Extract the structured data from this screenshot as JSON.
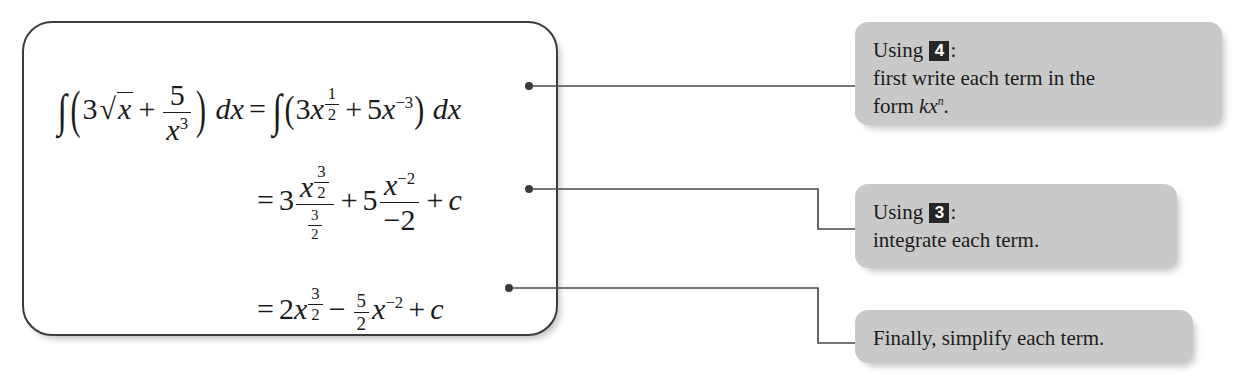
{
  "figure": {
    "type": "worked-example-with-callouts"
  },
  "work_box": {
    "equations": [
      {
        "id": "line-1",
        "plain": "∫(3√x + 5/x³) dx = ∫(3x^(1/2) + 5x^(-3)) dx",
        "parts": {
          "integral": "∫",
          "coefficient_1": "3",
          "radical": "√",
          "radicand": "x",
          "plus": "+",
          "frac_num": "5",
          "frac_den_base": "x",
          "frac_den_exp": "3",
          "dx": "dx",
          "equals": "=",
          "rhs_coeff_1": "3",
          "rhs_var_1": "x",
          "rhs_exp_1_num": "1",
          "rhs_exp_1_den": "2",
          "rhs_coeff_2": "5",
          "rhs_var_2": "x",
          "rhs_exp_2": "−3"
        }
      },
      {
        "id": "line-2",
        "plain": "= 3 · (x^(3/2))/(3/2) + 5 · (x^(-2))/(-2) + c",
        "parts": {
          "equals": "=",
          "coeff_1": "3",
          "num_var_1": "x",
          "num_exp_1_num": "3",
          "num_exp_1_den": "2",
          "den_1_num": "3",
          "den_1_den": "2",
          "plus_1": "+",
          "coeff_2": "5",
          "num_var_2": "x",
          "num_exp_2": "−2",
          "den_2": "−2",
          "plus_2": "+",
          "constant": "c"
        }
      },
      {
        "id": "line-3",
        "plain": "= 2x^(3/2) − (5/2) x^(-2) + c",
        "parts": {
          "equals": "=",
          "coeff_1": "2",
          "var_1": "x",
          "exp_1_num": "3",
          "exp_1_den": "2",
          "minus": "−",
          "frac_num": "5",
          "frac_den": "2",
          "var_2": "x",
          "exp_2": "−2",
          "plus": "+",
          "constant": "c"
        }
      }
    ]
  },
  "notes": [
    {
      "id": "note-1",
      "line_1_prefix": "Using",
      "badge": "4",
      "line_1_suffix": ":",
      "line_2": "first write each term in the",
      "line_3_prefix": "form",
      "line_3_math": "kx",
      "line_3_exp": "n",
      "line_3_suffix": "."
    },
    {
      "id": "note-2",
      "line_1_prefix": "Using",
      "badge": "3",
      "line_1_suffix": ":",
      "line_2": "integrate each term."
    },
    {
      "id": "note-3",
      "line_1": "Finally, simplify each term."
    }
  ],
  "colors": {
    "note_background": "#c9c9c9",
    "badge_background": "#262626",
    "badge_text": "#ffffff",
    "ink": "#1b1b1b",
    "box_border": "#3c3c3c",
    "connector": "#4a4a4a",
    "page_background": "#ffffff"
  },
  "connectors": [
    {
      "id": "connector-1",
      "from_equation": "line-1",
      "to_note": "note-1",
      "style": "straight"
    },
    {
      "id": "connector-2",
      "from_equation": "line-2",
      "to_note": "note-2",
      "style": "stepped"
    },
    {
      "id": "connector-3",
      "from_equation": "line-3",
      "to_note": "note-3",
      "style": "stepped"
    }
  ]
}
